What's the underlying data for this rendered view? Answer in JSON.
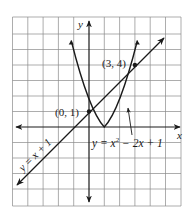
{
  "figure": {
    "axis_labels": {
      "x": "x",
      "y": "y"
    },
    "grid": {
      "xmin": -5,
      "xmax": 6,
      "ymin": -5,
      "ymax": 7
    },
    "curves": [
      {
        "name": "line",
        "equation": "y = x + 1",
        "color": "#1a1a1a"
      },
      {
        "name": "parabola",
        "equation": "y = x² − 2x + 1",
        "color": "#1a1a1a"
      }
    ],
    "points": [
      {
        "label": "(0, 1)",
        "x": 0,
        "y": 1
      },
      {
        "label": "(3, 4)",
        "x": 3,
        "y": 4
      }
    ],
    "labels": {
      "line_eq": "y = x + 1",
      "parabola_eq_main": "y = x",
      "parabola_eq_exp": "2",
      "parabola_eq_rest": " − 2x + 1",
      "point_a": "(0, 1)",
      "point_b": "(3, 4)"
    }
  }
}
